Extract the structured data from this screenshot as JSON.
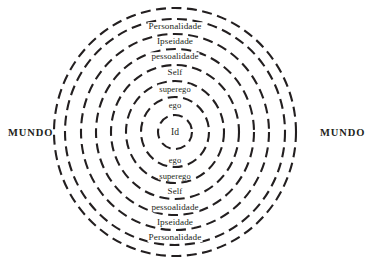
{
  "diagram": {
    "type": "concentric-circles",
    "center": {
      "x": 175,
      "y": 132
    },
    "stroke_color": "#231f20",
    "text_color": "#231f20",
    "background_color": "#ffffff",
    "line_style": "dashed",
    "stroke_width": 2.1,
    "dash_pattern": "10 5.5",
    "center_label": "Id",
    "center_radius": 17,
    "rings": [
      {
        "label": "ego",
        "radius_x": 34,
        "radius_y": 35,
        "font_size": 8.5
      },
      {
        "label": "superego",
        "radius_x": 49,
        "radius_y": 51,
        "font_size": 8.5
      },
      {
        "label": "Self",
        "radius_x": 64,
        "radius_y": 67,
        "font_size": 9.0
      },
      {
        "label": "pessoalidade",
        "radius_x": 79,
        "radius_y": 83,
        "font_size": 9.0
      },
      {
        "label": "Ipseidade",
        "radius_x": 94,
        "radius_y": 98,
        "font_size": 9.2
      },
      {
        "label": "Personalidade",
        "radius_x": 110,
        "radius_y": 113,
        "font_size": 9.2
      },
      {
        "label": "",
        "radius_x": 121,
        "radius_y": 124,
        "font_size": 9.2
      }
    ],
    "side_labels": {
      "left": "MUNDO",
      "right": "MUNDO"
    }
  }
}
